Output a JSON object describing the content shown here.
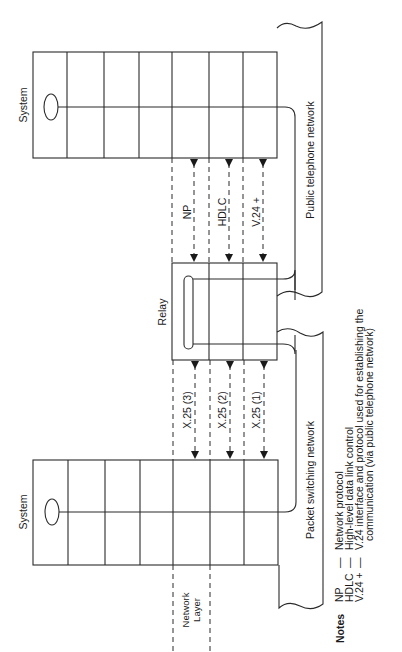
{
  "diagram": {
    "top_system": {
      "label": "System"
    },
    "bottom_system": {
      "label": "System"
    },
    "relay": {
      "label": "Relay"
    },
    "networks": {
      "public": "Public telephone network",
      "packet": "Packet switching network"
    },
    "upper_protocols": [
      {
        "label": "NP"
      },
      {
        "label": "HDLC"
      },
      {
        "label": "V.24 +"
      }
    ],
    "lower_protocols": [
      {
        "label": "X.25 (3)"
      },
      {
        "label": "X.25 (2)"
      },
      {
        "label": "X.25 (1)"
      }
    ],
    "layer_label_line1": "Network",
    "layer_label_line2": "Layer",
    "notes": {
      "title": "Notes",
      "items": [
        {
          "abbr": "NP",
          "dash": "—",
          "text": "Network protocol"
        },
        {
          "abbr": "HDLC",
          "dash": "—",
          "text": "High-level data link control"
        },
        {
          "abbr": "V.24 +",
          "dash": "—",
          "text": "V.24 interface and protocol used for establishing the"
        }
      ],
      "continuation": "communication (via public telephone network)"
    }
  }
}
